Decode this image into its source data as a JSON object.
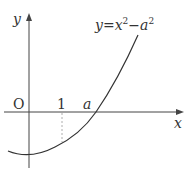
{
  "figure": {
    "equation": "y=x²−a²",
    "equation_parts": {
      "y": "y",
      "eq": "=",
      "x": "x",
      "sup1": "2",
      "minus": "−",
      "a": "a",
      "sup2": "2"
    },
    "axis_x_label": "x",
    "axis_y_label": "y",
    "origin_label": "O",
    "tick_label_1": "1",
    "tick_label_a": "a",
    "colors": {
      "stroke": "#333333",
      "dashed": "#888888",
      "background": "#ffffff"
    }
  }
}
